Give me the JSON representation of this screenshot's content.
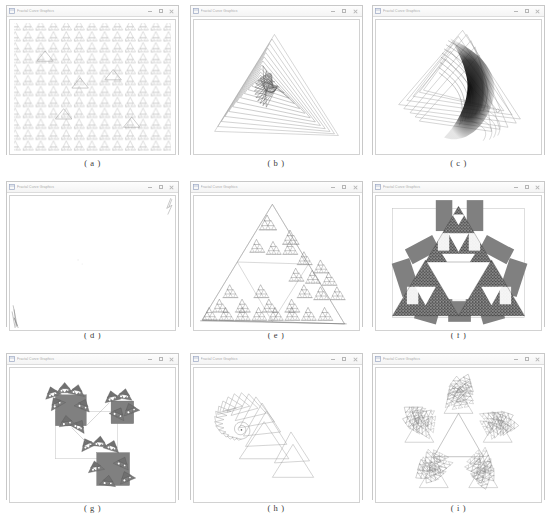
{
  "page": {
    "background": "#ffffff",
    "figure_type": "nine-panel screenshot grid of fractal / L-system rendering windows",
    "columns": 3,
    "rows": 3
  },
  "window_chrome": {
    "title": "Fractal Curve Graphics",
    "icon": "app-window-icon",
    "buttons": [
      {
        "name": "minimize-button",
        "glyph": "minimize"
      },
      {
        "name": "maximize-button",
        "glyph": "maximize"
      },
      {
        "name": "close-button",
        "glyph": "close"
      }
    ],
    "titlebar_color": "#f6f6f6",
    "border_color": "#c8c8c8",
    "canvas_color": "#ffffff"
  },
  "palette": {
    "ink_light": "#b9b9b9",
    "ink_mid": "#8a8a8a",
    "ink_dark": "#444444",
    "fill_grey": "#808080",
    "near_black": "#1a1a1a"
  },
  "panels": [
    {
      "id": "a",
      "caption": "( a )",
      "figure_name": "tiled-repeating-fractal-lattice",
      "description": "dense regular lattice of small repeated fractal motifs filling the canvas",
      "stroke": "#b0b0b0",
      "density": "very-high"
    },
    {
      "id": "b",
      "caption": "( b )",
      "figure_name": "triangular-logarithmic-spiral",
      "description": "nested rotating triangles converging into a logarithmic spiral centre",
      "stroke": "#8f8f8f",
      "density": "medium"
    },
    {
      "id": "c",
      "caption": "( c )",
      "figure_name": "crescent-chaotic-attractor",
      "description": "dense crescent shaped attractor formed by overlapping rotated triangles",
      "stroke": "#2a2a2a",
      "density": "very-high"
    },
    {
      "id": "d",
      "caption": "( d )",
      "figure_name": "degenerate-empty-canvas",
      "description": "nearly blank canvas with faint strokes at top-right and bottom-left corners",
      "stroke": "#9a9a9a",
      "density": "very-low"
    },
    {
      "id": "e",
      "caption": "( e )",
      "figure_name": "sierpinski-triangle-clusters",
      "description": "large outlined triangle with recursive clusters of small triangles",
      "stroke": "#6f6f6f",
      "density": "medium"
    },
    {
      "id": "f",
      "caption": "( f )",
      "figure_name": "grey-block-sierpinski-variant",
      "description": "sierpinski arrangement filled with grey rectangular blocks and white inner triangles",
      "stroke": "#333333",
      "fill": "#808080",
      "density": "high"
    },
    {
      "id": "g",
      "caption": "( g )",
      "figure_name": "diagonal-grey-square-fractal",
      "description": "three grey squares on a diagonal joined by thin lines with fractal fringes",
      "stroke": "#555555",
      "fill": "#808080",
      "density": "medium"
    },
    {
      "id": "h",
      "caption": "( h )",
      "figure_name": "nautilus-triangle-spiral",
      "description": "spiral of progressively shrinking triangles forming a nautilus shell",
      "stroke": "#9a9a9a",
      "density": "low"
    },
    {
      "id": "i",
      "caption": "( i )",
      "figure_name": "pentagonal-snowflake-fractal",
      "description": "five-fold symmetric snowflake of recursive triangles around a central triangle",
      "stroke": "#7d7d7d",
      "density": "medium"
    }
  ]
}
